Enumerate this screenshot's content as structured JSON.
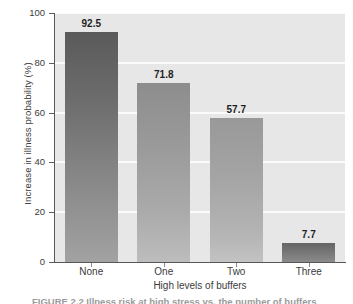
{
  "chart_data": {
    "type": "bar",
    "title": "",
    "xlabel": "High levels of buffers",
    "ylabel": "Increase in illness probability (%)",
    "categories": [
      "None",
      "One",
      "Two",
      "Three"
    ],
    "values": [
      92.5,
      71.8,
      57.7,
      7.7
    ],
    "value_labels": [
      "92.5",
      "71.8",
      "57.7",
      "7.7"
    ],
    "ylim": [
      0,
      100
    ],
    "ytick_labels": [
      "0",
      "20",
      "40",
      "60",
      "80",
      "100"
    ],
    "ytick_values": [
      0,
      20,
      40,
      60,
      80,
      100
    ],
    "grid": "horizontal",
    "legend": "none",
    "plot_background": "#e7e7e7",
    "gridline_color": "#fbfbfb",
    "axis_color": "#575757",
    "bar_colors": [
      "#6d6d6d",
      "#9a9a9a",
      "#a4a4a4",
      "#757575"
    ]
  },
  "caption": {
    "text": "FIGURE 2.2  Illness risk at high stress vs. the number of buffers"
  }
}
